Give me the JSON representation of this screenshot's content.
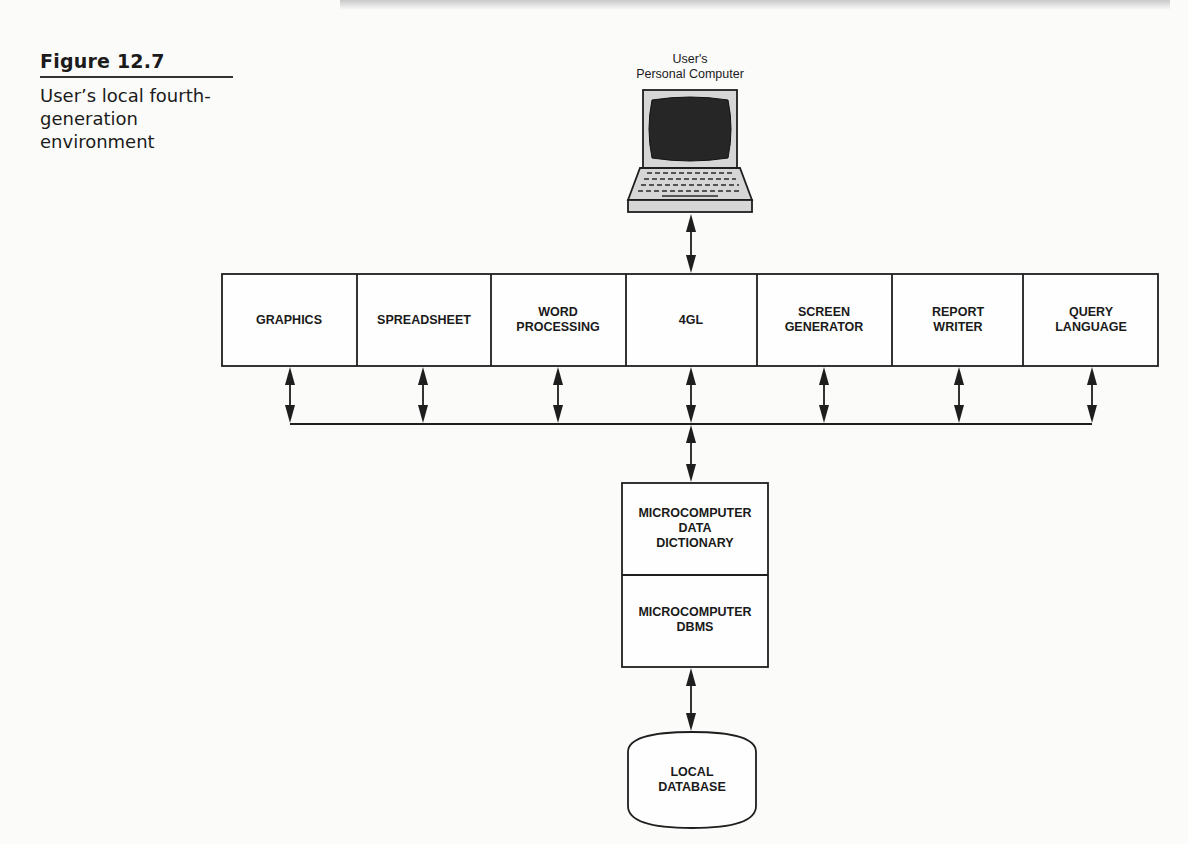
{
  "figure": {
    "number": "Figure 12.7",
    "title_lines": [
      "User’s local fourth-",
      "generation",
      "environment"
    ]
  },
  "computer": {
    "label_lines": [
      "User's",
      "Personal Computer"
    ],
    "icon": "laptop-computer-icon"
  },
  "tools": [
    {
      "id": "graphics",
      "lines": [
        "GRAPHICS"
      ]
    },
    {
      "id": "spreadsheet",
      "lines": [
        "SPREADSHEET"
      ]
    },
    {
      "id": "word-processing",
      "lines": [
        "WORD",
        "PROCESSING"
      ]
    },
    {
      "id": "4gl",
      "lines": [
        "4GL"
      ]
    },
    {
      "id": "screen-generator",
      "lines": [
        "SCREEN",
        "GENERATOR"
      ]
    },
    {
      "id": "report-writer",
      "lines": [
        "REPORT",
        "WRITER"
      ]
    },
    {
      "id": "query-language",
      "lines": [
        "QUERY",
        "LANGUAGE"
      ]
    }
  ],
  "data_dictionary": {
    "lines": [
      "MICROCOMPUTER",
      "DATA",
      "DICTIONARY"
    ]
  },
  "dbms": {
    "lines": [
      "MICROCOMPUTER",
      "DBMS"
    ]
  },
  "database": {
    "lines": [
      "LOCAL",
      "DATABASE"
    ],
    "icon": "database-cylinder-icon"
  },
  "connections": [
    {
      "from": "computer",
      "to": "4gl",
      "type": "bidirectional"
    },
    {
      "from": "graphics",
      "to": "bus",
      "type": "bidirectional"
    },
    {
      "from": "spreadsheet",
      "to": "bus",
      "type": "bidirectional"
    },
    {
      "from": "word-processing",
      "to": "bus",
      "type": "bidirectional"
    },
    {
      "from": "4gl",
      "to": "bus",
      "type": "bidirectional"
    },
    {
      "from": "screen-generator",
      "to": "bus",
      "type": "bidirectional"
    },
    {
      "from": "report-writer",
      "to": "bus",
      "type": "bidirectional"
    },
    {
      "from": "query-language",
      "to": "bus",
      "type": "bidirectional"
    },
    {
      "from": "bus",
      "to": "data_dictionary",
      "type": "bidirectional"
    },
    {
      "from": "dbms",
      "to": "database",
      "type": "bidirectional"
    }
  ]
}
